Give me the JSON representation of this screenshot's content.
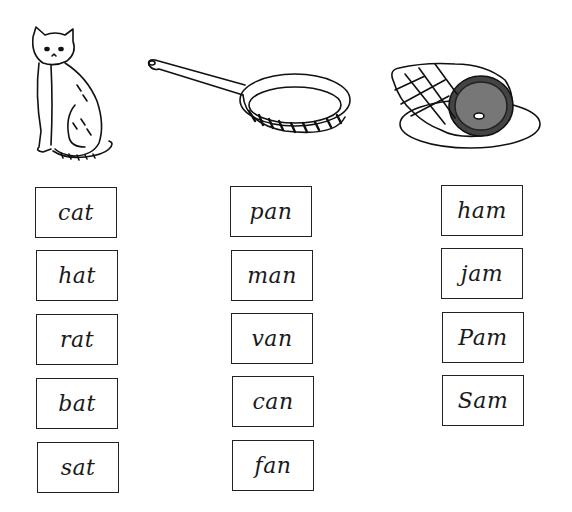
{
  "worksheet": {
    "columns": [
      {
        "picture": "cat-drawing",
        "words": [
          "cat",
          "hat",
          "rat",
          "bat",
          "sat"
        ]
      },
      {
        "picture": "frying-pan-drawing",
        "words": [
          "pan",
          "man",
          "van",
          "can",
          "fan"
        ]
      },
      {
        "picture": "ham-on-plate-drawing",
        "words": [
          "ham",
          "jam",
          "Pam",
          "Sam"
        ]
      }
    ]
  }
}
